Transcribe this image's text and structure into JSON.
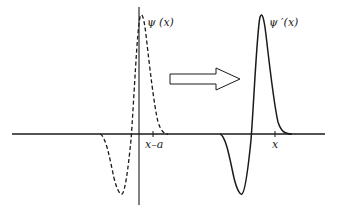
{
  "diagram": {
    "type": "function-translation",
    "colors": {
      "ink": "#1a1a1a",
      "background": "#ffffff"
    },
    "curves": [
      {
        "name": "original",
        "label": "ψ (x)",
        "style": "dashed",
        "tick_label": "x–a"
      },
      {
        "name": "translated",
        "label": "ψ ′(x)",
        "style": "solid",
        "tick_label": "x"
      }
    ],
    "arrow": {
      "shape": "hollow-right-arrow",
      "meaning": "translation"
    }
  }
}
